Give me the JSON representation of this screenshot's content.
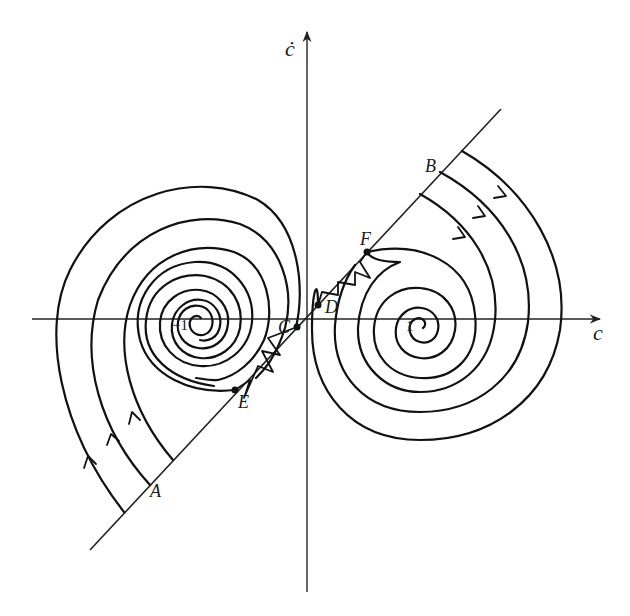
{
  "figure": {
    "axes": {
      "x_label": "c",
      "y_label": "ċ",
      "tick_left": "−1",
      "tick_right": "1"
    },
    "points": {
      "A": "A",
      "B": "B",
      "C": "C",
      "D": "D",
      "E": "E",
      "F": "F"
    }
  }
}
